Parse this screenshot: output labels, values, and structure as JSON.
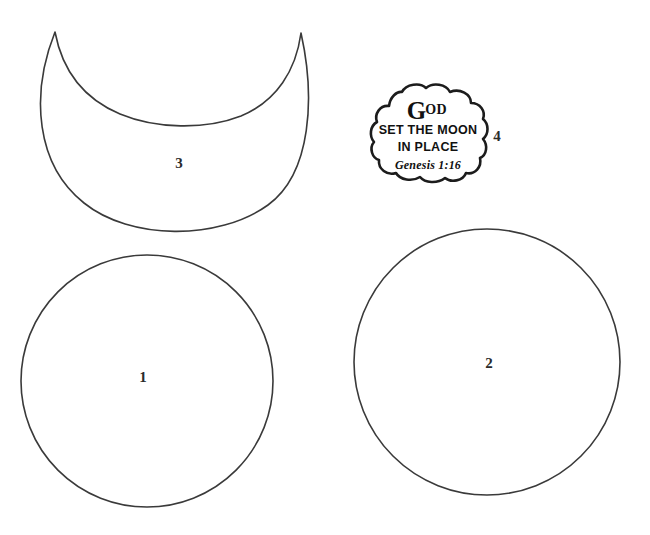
{
  "sheet": {
    "title": "Moon Craft Pattern Template",
    "background_color": "#ffffff",
    "outline_color": "#3a3a3a",
    "ink_color": "#111111",
    "width": 650,
    "height": 535
  },
  "pieces": [
    {
      "id": "piece-1",
      "number": "1",
      "shape": "circle",
      "number_x": 143,
      "number_y": 377
    },
    {
      "id": "piece-2",
      "number": "2",
      "shape": "circle",
      "number_x": 489,
      "number_y": 363
    },
    {
      "id": "piece-3",
      "number": "3",
      "shape": "crescent-moon",
      "number_x": 179,
      "number_y": 163
    },
    {
      "id": "piece-4",
      "number": "4",
      "shape": "cloud-caption-banner",
      "number_x": 497,
      "number_y": 136
    }
  ],
  "caption": {
    "dropcap": "G",
    "word_rest": "OD",
    "line2": "SET THE MOON",
    "line3": "IN PLACE",
    "reference": "Genesis 1:16"
  }
}
